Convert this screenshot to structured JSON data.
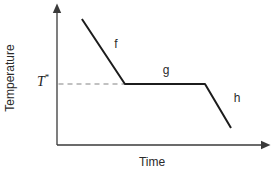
{
  "labels": {
    "y_axis": "Temperature",
    "x_axis": "Time",
    "reference_base": "T",
    "reference_sup": "*"
  },
  "chart_data": {
    "type": "line",
    "title": "",
    "xlabel": "Time",
    "ylabel": "Temperature",
    "axes_quantitative": false,
    "x_range": [
      0,
      1
    ],
    "y_range": [
      0,
      1
    ],
    "grid": false,
    "legend": false,
    "series": [
      {
        "name": "cooling curve",
        "points": [
          [
            0.117,
            0.9
          ],
          [
            0.319,
            0.436
          ],
          [
            0.695,
            0.436
          ],
          [
            0.817,
            0.121
          ]
        ]
      }
    ],
    "segments": [
      {
        "label": "f",
        "label_pos": [
          0.277,
          0.72
        ]
      },
      {
        "label": "g",
        "label_pos": [
          0.512,
          0.536
        ]
      },
      {
        "label": "h",
        "label_pos": [
          0.845,
          0.336
        ]
      }
    ],
    "reference_line": {
      "label": "T*",
      "y": 0.436,
      "x_from": 0.007,
      "x_to": 0.319,
      "style": "dashed"
    },
    "colors": {
      "curve": "#1c1c1c",
      "axis": "#3a3a3a",
      "dashed_line": "#adadad",
      "text": "#2a2a2a"
    }
  }
}
